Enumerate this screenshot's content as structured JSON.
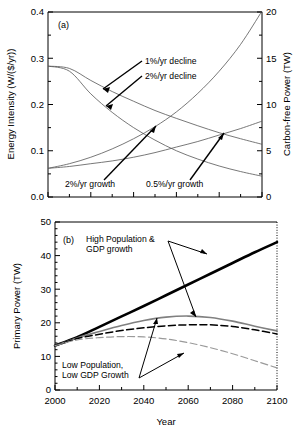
{
  "figure": {
    "width": 300,
    "height": 435,
    "background": "#ffffff"
  },
  "chart_data": [
    {
      "type": "line",
      "panel": "a",
      "panel_label": "(a)",
      "title": "",
      "xlabel": "",
      "ylabel": "Energy Intensity (W/($/yr))",
      "y2label": "Carbon-free Power (TW)",
      "xlim": [
        2000,
        2100
      ],
      "ylim": [
        0.0,
        0.4
      ],
      "y2lim": [
        0,
        20
      ],
      "grid": false,
      "legend": "annotations",
      "xticks": [
        2000,
        2010,
        2020,
        2030,
        2040,
        2050,
        2060,
        2070,
        2080,
        2090,
        2100
      ],
      "xticklabels": [
        "",
        "",
        "",
        "",
        "",
        "",
        "",
        "",
        "",
        "",
        ""
      ],
      "yticks": [
        0.0,
        0.1,
        0.2,
        0.3,
        0.4
      ],
      "yticklabels": [
        "0.0",
        "0.1",
        "0.2",
        "0.3",
        "0.4"
      ],
      "y2ticks": [
        0,
        5,
        10,
        15,
        20
      ],
      "y2ticklabels": [
        "0",
        "5",
        "10",
        "15",
        "20"
      ],
      "x": [
        2000,
        2010,
        2020,
        2030,
        2040,
        2050,
        2060,
        2070,
        2080,
        2090,
        2100
      ],
      "series": [
        {
          "name": "1%/yr decline",
          "axis": "left",
          "style": "solid-thin",
          "color": "#555555",
          "values": [
            0.283,
            0.278,
            0.252,
            0.228,
            0.207,
            0.187,
            0.17,
            0.154,
            0.139,
            0.126,
            0.114
          ]
        },
        {
          "name": "2%/yr decline",
          "axis": "left",
          "style": "solid-thin",
          "color": "#555555",
          "values": [
            0.283,
            0.272,
            0.223,
            0.183,
            0.15,
            0.123,
            0.1,
            0.082,
            0.067,
            0.055,
            0.045
          ]
        },
        {
          "name": "2%/yr growth",
          "axis": "right",
          "style": "solid-thin",
          "color": "#555555",
          "values": [
            3.1,
            3.6,
            4.3,
            5.2,
            6.3,
            7.6,
            9.2,
            11.2,
            13.6,
            16.5,
            20.1
          ]
        },
        {
          "name": "0.5%/yr growth",
          "axis": "right",
          "style": "solid-thin",
          "color": "#555555",
          "values": [
            3.1,
            3.3,
            3.6,
            3.9,
            4.3,
            4.8,
            5.4,
            6.0,
            6.7,
            7.4,
            8.2
          ]
        }
      ],
      "annotations": [
        {
          "text": "1%/yr decline",
          "x": 2038,
          "y": 0.318
        },
        {
          "text": "2%/yr decline",
          "x": 2038,
          "y": 0.278
        },
        {
          "text": "2%/yr growth",
          "x": 2019,
          "y": 0.034
        },
        {
          "text": "0.5%/yr growth",
          "x": 2052,
          "y": 0.034
        }
      ]
    },
    {
      "type": "line",
      "panel": "b",
      "panel_label": "(b)",
      "title": "",
      "xlabel": "Year",
      "ylabel": "Primary Power (TW)",
      "xlim": [
        2000,
        2100
      ],
      "ylim": [
        0,
        50
      ],
      "grid": false,
      "legend": "annotations",
      "xticks": [
        2000,
        2020,
        2040,
        2060,
        2080,
        2100
      ],
      "xticklabels": [
        "2000",
        "2020",
        "2040",
        "2060",
        "2080",
        "2100"
      ],
      "xminorticks": [
        2010,
        2030,
        2050,
        2070,
        2090
      ],
      "yticks": [
        0,
        10,
        20,
        30,
        40,
        50
      ],
      "yticklabels": [
        "0",
        "10",
        "20",
        "30",
        "40",
        "50"
      ],
      "x": [
        2000,
        2010,
        2020,
        2030,
        2040,
        2050,
        2060,
        2070,
        2080,
        2090,
        2100
      ],
      "series": [
        {
          "name": "High Population & GDP growth",
          "style": "solid-thick",
          "color": "#000000",
          "values": [
            13.2,
            15.7,
            18.8,
            21.9,
            25.0,
            28.2,
            31.4,
            34.6,
            37.8,
            41.0,
            44.0
          ]
        },
        {
          "name": "High Population & GDP growth (mid)",
          "style": "solid-gray",
          "color": "#808080",
          "values": [
            13.2,
            15.5,
            17.4,
            19.2,
            20.7,
            21.7,
            22.0,
            21.6,
            20.5,
            19.0,
            17.6
          ]
        },
        {
          "name": "Mid case (dashed)",
          "style": "dashed-black",
          "color": "#000000",
          "values": [
            13.2,
            15.3,
            16.6,
            17.7,
            18.5,
            19.1,
            19.4,
            19.4,
            18.9,
            17.9,
            16.7
          ]
        },
        {
          "name": "Low Population, Low GDP Growth",
          "style": "dashed-gray",
          "color": "#9a9a9a",
          "values": [
            13.2,
            14.9,
            15.6,
            15.9,
            15.8,
            15.2,
            14.1,
            12.6,
            10.8,
            8.7,
            6.6
          ]
        }
      ],
      "annotations": [
        {
          "text_line1": "High Population &",
          "text_line2": "GDP growth",
          "x": 2016,
          "y": 45.0
        },
        {
          "text_line1": "Low Population,",
          "text_line2": "Low GDP Growth",
          "x": 2012,
          "y": 7.6
        }
      ]
    }
  ]
}
